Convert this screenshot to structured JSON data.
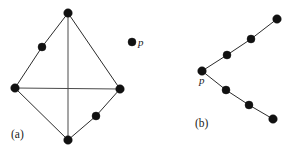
{
  "figure": {
    "width": 293,
    "height": 152,
    "background_color": "#ffffff",
    "node_color": "#111111",
    "edge_color": "#2b2b2b",
    "diagonal_color": "#4a4a4a",
    "label_color": "#1a1a1a"
  },
  "labels": {
    "panel_a": "(a)",
    "panel_b": "(b)",
    "point_p_a": "p",
    "point_p_b": "p"
  },
  "chart_data": {
    "type": "scatter",
    "title": "",
    "xlabel": "",
    "ylabel": "",
    "grid": false,
    "legend": "none",
    "xlim": [
      0,
      293
    ],
    "ylim": [
      0,
      152
    ],
    "panels": [
      {
        "name": "a",
        "label": "(a)",
        "label_x": 11,
        "label_y": 129,
        "description": "Quadrilateral (rhombus) with both diagonals drawn, two extra collinear points on edges, and one isolated point p",
        "nodes": [
          {
            "id": "a-top",
            "x": 68,
            "y": 13,
            "r": 4.3,
            "label": ""
          },
          {
            "id": "a-upper-left",
            "x": 42,
            "y": 47,
            "r": 4.0,
            "label": ""
          },
          {
            "id": "a-left",
            "x": 15,
            "y": 88,
            "r": 4.3,
            "label": ""
          },
          {
            "id": "a-right",
            "x": 120,
            "y": 89,
            "r": 4.3,
            "label": ""
          },
          {
            "id": "a-lower-right",
            "x": 96,
            "y": 116,
            "r": 4.0,
            "label": ""
          },
          {
            "id": "a-bottom",
            "x": 68,
            "y": 140,
            "r": 4.3,
            "label": ""
          },
          {
            "id": "a-isolated-p",
            "x": 132,
            "y": 42,
            "r": 4.0,
            "label": "p"
          }
        ],
        "edges": [
          {
            "from": "a-top",
            "to": "a-upper-left",
            "kind": "outline"
          },
          {
            "from": "a-upper-left",
            "to": "a-left",
            "kind": "outline"
          },
          {
            "from": "a-top",
            "to": "a-right",
            "kind": "outline"
          },
          {
            "from": "a-right",
            "to": "a-lower-right",
            "kind": "outline"
          },
          {
            "from": "a-lower-right",
            "to": "a-bottom",
            "kind": "outline"
          },
          {
            "from": "a-left",
            "to": "a-bottom",
            "kind": "outline"
          },
          {
            "from": "a-top",
            "to": "a-bottom",
            "kind": "diagonal"
          },
          {
            "from": "a-left",
            "to": "a-right",
            "kind": "diagonal"
          }
        ]
      },
      {
        "name": "b",
        "label": "(b)",
        "label_x": 195,
        "label_y": 118,
        "description": "Chevron / V shape opening rightward with apex vertex p and three collinear nodes on each arm",
        "nodes": [
          {
            "id": "b-p",
            "x": 202,
            "y": 71,
            "r": 4.3,
            "label": "p"
          },
          {
            "id": "b-up-1",
            "x": 227,
            "y": 55,
            "r": 4.0,
            "label": ""
          },
          {
            "id": "b-up-2",
            "x": 251,
            "y": 39,
            "r": 4.0,
            "label": ""
          },
          {
            "id": "b-up-3",
            "x": 277,
            "y": 19,
            "r": 4.3,
            "label": ""
          },
          {
            "id": "b-dn-1",
            "x": 226,
            "y": 90,
            "r": 4.0,
            "label": ""
          },
          {
            "id": "b-dn-2",
            "x": 249,
            "y": 105,
            "r": 4.0,
            "label": ""
          },
          {
            "id": "b-dn-3",
            "x": 273,
            "y": 119,
            "r": 4.3,
            "label": ""
          }
        ],
        "edges": [
          {
            "from": "b-p",
            "to": "b-up-1",
            "kind": "outline"
          },
          {
            "from": "b-up-1",
            "to": "b-up-2",
            "kind": "outline"
          },
          {
            "from": "b-up-2",
            "to": "b-up-3",
            "kind": "outline"
          },
          {
            "from": "b-p",
            "to": "b-dn-1",
            "kind": "outline"
          },
          {
            "from": "b-dn-1",
            "to": "b-dn-2",
            "kind": "outline"
          },
          {
            "from": "b-dn-2",
            "to": "b-dn-3",
            "kind": "outline"
          }
        ]
      }
    ]
  }
}
